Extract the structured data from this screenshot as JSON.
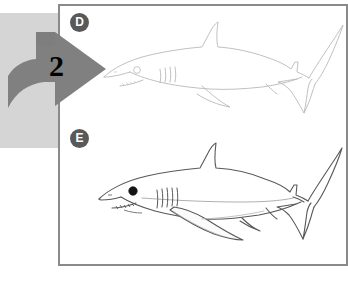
{
  "figure": {
    "background_color": "#ffffff",
    "panel_border_color": "#8a8a8a",
    "gray_block_color": "#d5d5d5",
    "arrow_color": "#808080",
    "badge_color": "#595959",
    "badge_text_color": "#ffffff"
  },
  "step_arrow": {
    "name": "step-2-arrow",
    "number": "2",
    "direction": "right",
    "color": "#808080"
  },
  "panels": [
    {
      "badge": "D",
      "subject": "shark",
      "style": "light outline drawing",
      "line_color": "#b8b8b8",
      "eye": "open circle",
      "eye_color": "#c8c8c8"
    },
    {
      "badge": "E",
      "subject": "shark",
      "style": "dark outline drawing with shading",
      "line_color": "#555555",
      "eye": "solid filled",
      "eye_color": "#111111"
    }
  ],
  "alt_text": {
    "panel_d": "Panel D: faint outline drawing of a shark facing left",
    "panel_e": "Panel E: darker outline drawing of a shark facing left with filled eye and pectoral fin"
  }
}
